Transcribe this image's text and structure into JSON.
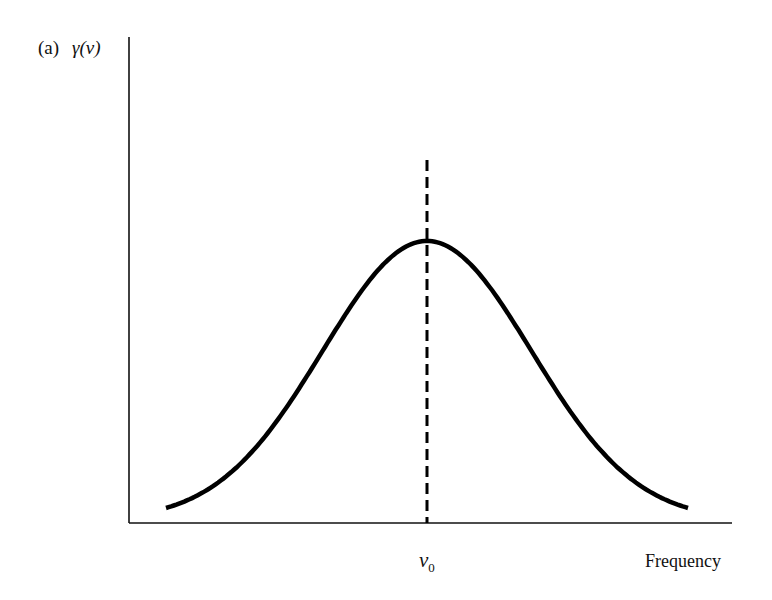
{
  "chart_data": {
    "type": "line",
    "title": "",
    "panel_label": "(a)",
    "ylabel": "γ(ν)",
    "xlabel": "Frequency",
    "x_tick_labels": [
      {
        "label": "ν0",
        "base": "ν",
        "sub": "0",
        "x": 0
      }
    ],
    "grid": false,
    "legend": null,
    "series": [
      {
        "name": "γ(ν)",
        "shape": "gaussian",
        "center": 0,
        "x_range": [
          -2.5,
          2.5
        ],
        "peak_value": 1.0,
        "tail_value": 0.05,
        "points": [
          {
            "x": -2.5,
            "y": 0.05
          },
          {
            "x": -2.0,
            "y": 0.14
          },
          {
            "x": -1.5,
            "y": 0.32
          },
          {
            "x": -1.0,
            "y": 0.6
          },
          {
            "x": -0.5,
            "y": 0.88
          },
          {
            "x": 0.0,
            "y": 1.0
          },
          {
            "x": 0.5,
            "y": 0.88
          },
          {
            "x": 1.0,
            "y": 0.6
          },
          {
            "x": 1.5,
            "y": 0.32
          },
          {
            "x": 2.0,
            "y": 0.14
          },
          {
            "x": 2.5,
            "y": 0.05
          }
        ]
      }
    ],
    "annotations": [
      {
        "type": "vline",
        "x": 0,
        "style": "dashed",
        "label": "ν0"
      }
    ]
  },
  "labels": {
    "panel": "(a)",
    "y_axis": "γ(ν)",
    "x_axis": "Frequency",
    "center_base": "ν",
    "center_sub": "0"
  },
  "colors": {
    "line": "#000000",
    "axis": "#111111",
    "background": "#ffffff"
  }
}
